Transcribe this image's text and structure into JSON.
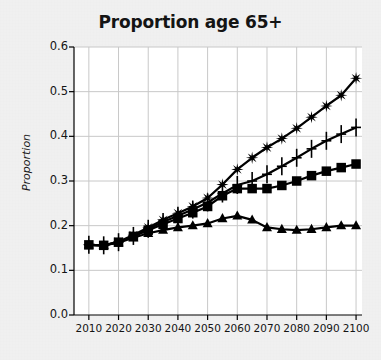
{
  "chart_data": {
    "type": "line",
    "title": "Proportion age 65+",
    "xlabel": "",
    "ylabel": "Proportion",
    "x": [
      2010,
      2015,
      2020,
      2025,
      2030,
      2035,
      2040,
      2045,
      2050,
      2055,
      2060,
      2065,
      2070,
      2075,
      2080,
      2085,
      2090,
      2095,
      2100
    ],
    "xlim": [
      2005,
      2102
    ],
    "ylim": [
      0.0,
      0.6
    ],
    "xticks": [
      2010,
      2020,
      2030,
      2040,
      2050,
      2060,
      2070,
      2080,
      2090,
      2100
    ],
    "xtick_labels": [
      "2010",
      "2020",
      "2030",
      "2040",
      "2050",
      "2060",
      "2070",
      "2080",
      "2090",
      "2100"
    ],
    "yticks": [
      0.0,
      0.1,
      0.2,
      0.3,
      0.4,
      0.5,
      0.6
    ],
    "ytick_labels": [
      "0.0",
      "0.1",
      "0.2",
      "0.3",
      "0.4",
      "0.5",
      "0.6"
    ],
    "grid": true,
    "legend": false,
    "legend_position": "none",
    "series": [
      {
        "name": "series-star",
        "marker": "star",
        "values": [
          0.157,
          0.156,
          0.164,
          0.179,
          0.196,
          0.213,
          0.228,
          0.243,
          0.262,
          0.292,
          0.326,
          0.352,
          0.375,
          0.395,
          0.418,
          0.443,
          0.468,
          0.492,
          0.53
        ]
      },
      {
        "name": "series-plus",
        "marker": "plus",
        "values": [
          0.157,
          0.156,
          0.163,
          0.177,
          0.193,
          0.208,
          0.222,
          0.236,
          0.252,
          0.272,
          0.291,
          0.3,
          0.315,
          0.333,
          0.352,
          0.372,
          0.39,
          0.405,
          0.42
        ]
      },
      {
        "name": "series-square",
        "marker": "square",
        "values": [
          0.157,
          0.156,
          0.163,
          0.176,
          0.19,
          0.203,
          0.216,
          0.229,
          0.243,
          0.267,
          0.283,
          0.283,
          0.283,
          0.29,
          0.3,
          0.312,
          0.322,
          0.33,
          0.338
        ]
      },
      {
        "name": "series-triangle",
        "marker": "triangle",
        "values": [
          0.157,
          0.156,
          0.162,
          0.173,
          0.183,
          0.19,
          0.196,
          0.2,
          0.205,
          0.216,
          0.222,
          0.213,
          0.196,
          0.192,
          0.19,
          0.192,
          0.196,
          0.2,
          0.2
        ]
      }
    ],
    "colors": {
      "series": "#000000",
      "grid": "#c8c8c8",
      "axis": "#000000",
      "plot_background": "#ffffff",
      "figure_background": "#f2f2f2",
      "text": "#141414"
    }
  }
}
